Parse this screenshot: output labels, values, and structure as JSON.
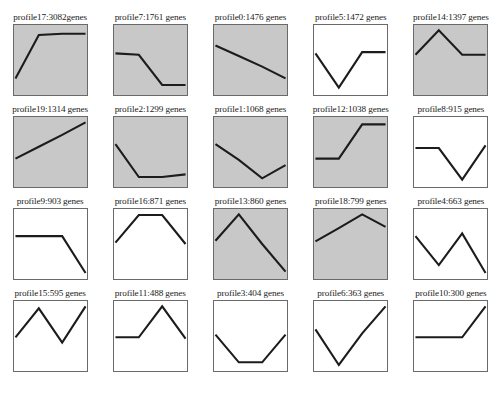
{
  "figure": {
    "background_color": "#ffffff",
    "line_color": "#1c1c1c",
    "border_color": "#6a6a6a",
    "shaded_fill": "#c8c8c8",
    "plain_fill": "#ffffff",
    "columns": 5,
    "rows": 4
  },
  "chart_data": {
    "type": "line",
    "title": "",
    "xlabel": "",
    "ylabel": "",
    "xlim": [
      0,
      3
    ],
    "ylim": [
      0,
      1
    ],
    "grid": false,
    "legend": "none",
    "note": "Grid of 20 small multiple gene expression profile line plots; each panel title is 'profileN:COUNT genes'. Shaded (gray) panels mark statistically significant profiles.",
    "panels": [
      {
        "index": 0,
        "label": "profile17:3082genes",
        "profile_id": 17,
        "gene_count": 3082,
        "shaded": true,
        "x": [
          0,
          1,
          2,
          3
        ],
        "values": [
          0.22,
          0.88,
          0.9,
          0.9
        ]
      },
      {
        "index": 1,
        "label": "profile7:1761 genes",
        "profile_id": 7,
        "gene_count": 1761,
        "shaded": true,
        "x": [
          0,
          1,
          2,
          3
        ],
        "values": [
          0.6,
          0.58,
          0.12,
          0.12
        ]
      },
      {
        "index": 2,
        "label": "profile0:1476 genes",
        "profile_id": 0,
        "gene_count": 1476,
        "shaded": true,
        "x": [
          0,
          1,
          2,
          3
        ],
        "values": [
          0.72,
          0.56,
          0.4,
          0.22
        ]
      },
      {
        "index": 3,
        "label": "profile5:1472 genes",
        "profile_id": 5,
        "gene_count": 1472,
        "shaded": false,
        "x": [
          0,
          1,
          2,
          3
        ],
        "values": [
          0.6,
          0.08,
          0.62,
          0.62
        ]
      },
      {
        "index": 4,
        "label": "profile14:1397 genes",
        "profile_id": 14,
        "gene_count": 1397,
        "shaded": true,
        "x": [
          0,
          1,
          2,
          3
        ],
        "values": [
          0.58,
          0.95,
          0.58,
          0.58
        ]
      },
      {
        "index": 5,
        "label": "profile19:1314 genes",
        "profile_id": 19,
        "gene_count": 1314,
        "shaded": true,
        "x": [
          0,
          1,
          2,
          3
        ],
        "values": [
          0.4,
          0.58,
          0.76,
          0.95
        ]
      },
      {
        "index": 6,
        "label": "profile2:1299 genes",
        "profile_id": 2,
        "gene_count": 1299,
        "shaded": true,
        "x": [
          0,
          1,
          2,
          3
        ],
        "values": [
          0.62,
          0.12,
          0.12,
          0.16
        ]
      },
      {
        "index": 7,
        "label": "profile1:1068 genes",
        "profile_id": 1,
        "gene_count": 1068,
        "shaded": true,
        "x": [
          0,
          1,
          2,
          3
        ],
        "values": [
          0.62,
          0.38,
          0.1,
          0.3
        ]
      },
      {
        "index": 8,
        "label": "profile12:1038 genes",
        "profile_id": 12,
        "gene_count": 1038,
        "shaded": true,
        "x": [
          0,
          1,
          2,
          3
        ],
        "values": [
          0.4,
          0.4,
          0.92,
          0.92
        ]
      },
      {
        "index": 9,
        "label": "profile8:915 genes",
        "profile_id": 8,
        "gene_count": 915,
        "shaded": false,
        "x": [
          0,
          1,
          2,
          3
        ],
        "values": [
          0.56,
          0.56,
          0.08,
          0.6
        ]
      },
      {
        "index": 10,
        "label": "profile9:903 genes",
        "profile_id": 9,
        "gene_count": 903,
        "shaded": false,
        "x": [
          0,
          1,
          2,
          3
        ],
        "values": [
          0.62,
          0.62,
          0.62,
          0.06
        ]
      },
      {
        "index": 11,
        "label": "profile16:871 genes",
        "profile_id": 16,
        "gene_count": 871,
        "shaded": false,
        "x": [
          0,
          1,
          2,
          3
        ],
        "values": [
          0.52,
          0.94,
          0.94,
          0.5
        ]
      },
      {
        "index": 12,
        "label": "profile13:860 genes",
        "profile_id": 13,
        "gene_count": 860,
        "shaded": true,
        "x": [
          0,
          1,
          2,
          3
        ],
        "values": [
          0.55,
          0.95,
          0.5,
          0.08
        ]
      },
      {
        "index": 13,
        "label": "profile18:799 genes",
        "profile_id": 18,
        "gene_count": 799,
        "shaded": true,
        "x": [
          0,
          1,
          2,
          3
        ],
        "values": [
          0.54,
          0.74,
          0.95,
          0.76
        ]
      },
      {
        "index": 14,
        "label": "profile4:663 genes",
        "profile_id": 4,
        "gene_count": 663,
        "shaded": false,
        "x": [
          0,
          1,
          2,
          3
        ],
        "values": [
          0.62,
          0.18,
          0.66,
          0.06
        ]
      },
      {
        "index": 15,
        "label": "profile15:595 genes",
        "profile_id": 15,
        "gene_count": 595,
        "shaded": false,
        "x": [
          0,
          1,
          2,
          3
        ],
        "values": [
          0.48,
          0.92,
          0.4,
          0.95
        ]
      },
      {
        "index": 16,
        "label": "profile11:488 genes",
        "profile_id": 11,
        "gene_count": 488,
        "shaded": false,
        "x": [
          0,
          1,
          2,
          3
        ],
        "values": [
          0.48,
          0.48,
          0.95,
          0.46
        ]
      },
      {
        "index": 17,
        "label": "profile3:404 genes",
        "profile_id": 3,
        "gene_count": 404,
        "shaded": false,
        "x": [
          0,
          1,
          2,
          3
        ],
        "values": [
          0.52,
          0.1,
          0.1,
          0.52
        ]
      },
      {
        "index": 18,
        "label": "profile6:363 genes",
        "profile_id": 6,
        "gene_count": 363,
        "shaded": false,
        "x": [
          0,
          1,
          2,
          3
        ],
        "values": [
          0.6,
          0.06,
          0.54,
          0.95
        ]
      },
      {
        "index": 19,
        "label": "profile10:300 genes",
        "profile_id": 10,
        "gene_count": 300,
        "shaded": false,
        "x": [
          0,
          1,
          2,
          3
        ],
        "values": [
          0.48,
          0.48,
          0.48,
          0.95
        ]
      }
    ]
  }
}
